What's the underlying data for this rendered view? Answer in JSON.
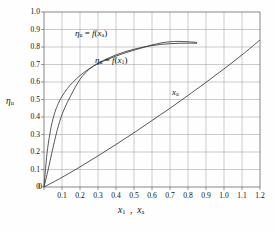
{
  "chart_data": {
    "type": "line",
    "title": "",
    "xlabel": "x1 , xa",
    "ylabel": "ηu",
    "xlim": [
      0,
      1.2
    ],
    "ylim": [
      0,
      1.0
    ],
    "grid": true,
    "legend": "inline-annotations",
    "x_ticks": [
      "0",
      "0.1",
      "0.2",
      "0.3",
      "0.4",
      "0.5",
      "0.6",
      "0.7",
      "0.8",
      "0.9",
      "1.0",
      "1.1",
      "1.2"
    ],
    "y_ticks": [
      "0",
      "0.1",
      "0.2",
      "0.3",
      "0.4",
      "0.5",
      "0.6",
      "0.7",
      "0.8",
      "0.9",
      "1.0"
    ],
    "series": [
      {
        "name": "ηu = f(xa)",
        "label_text": "ηu = f(xa)",
        "x": [
          0.0,
          0.01,
          0.02,
          0.04,
          0.06,
          0.08,
          0.1,
          0.13,
          0.16,
          0.2,
          0.25,
          0.3,
          0.35,
          0.4,
          0.45,
          0.5,
          0.55,
          0.6,
          0.65,
          0.7,
          0.75,
          0.8,
          0.85
        ],
        "values": [
          0.0,
          0.12,
          0.22,
          0.345,
          0.425,
          0.478,
          0.518,
          0.563,
          0.598,
          0.637,
          0.675,
          0.705,
          0.728,
          0.748,
          0.766,
          0.782,
          0.797,
          0.812,
          0.823,
          0.83,
          0.832,
          0.83,
          0.826
        ]
      },
      {
        "name": "ηu = f(x1)",
        "label_text": "ηu = f(x1)",
        "x": [
          0.0,
          0.02,
          0.05,
          0.08,
          0.11,
          0.15,
          0.2,
          0.25,
          0.3,
          0.35,
          0.4,
          0.45,
          0.5,
          0.55,
          0.6,
          0.65,
          0.7,
          0.75,
          0.8,
          0.85
        ],
        "values": [
          0.0,
          0.085,
          0.225,
          0.35,
          0.44,
          0.525,
          0.615,
          0.672,
          0.707,
          0.733,
          0.755,
          0.773,
          0.787,
          0.799,
          0.808,
          0.815,
          0.819,
          0.821,
          0.822,
          0.821
        ]
      },
      {
        "name": "xa",
        "label_text": "xa",
        "x": [
          0.0,
          0.1,
          0.2,
          0.3,
          0.4,
          0.5,
          0.6,
          0.7,
          0.8,
          0.9,
          1.0,
          1.1,
          1.2
        ],
        "values": [
          0.0,
          0.055,
          0.115,
          0.178,
          0.243,
          0.31,
          0.38,
          0.45,
          0.523,
          0.598,
          0.675,
          0.755,
          0.84
        ]
      }
    ],
    "annotations": [
      {
        "name": "label-eta-fxa",
        "text": "ηu = f(xa)"
      },
      {
        "name": "label-eta-fx1",
        "text": "ηu = f(x1)"
      },
      {
        "name": "label-xa",
        "text": "xa"
      }
    ],
    "colors": {
      "curve": "#3a3a3a",
      "grid": "#9a9a9a",
      "frame": "#6b6b6b",
      "background": "#fefefe"
    }
  }
}
